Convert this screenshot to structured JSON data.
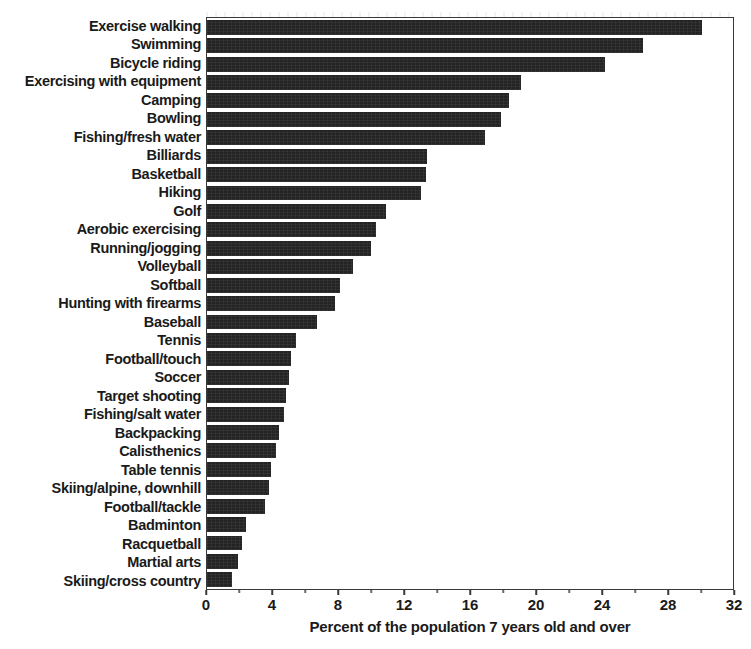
{
  "chart_data": {
    "type": "bar",
    "orientation": "horizontal",
    "title": "",
    "xlabel": "Percent of the population 7 years old and over",
    "ylabel": "",
    "xlim": [
      0,
      32
    ],
    "xticks": [
      0,
      4,
      8,
      12,
      16,
      20,
      24,
      28,
      32
    ],
    "xtick_labels": [
      "0",
      "4",
      "8",
      "12",
      "16",
      "20",
      "24",
      "28",
      "32"
    ],
    "grid": false,
    "legend": false,
    "bar_color": "#242424",
    "frame_color": "#3a3a3a",
    "categories": [
      "Exercise walking",
      "Swimming",
      "Bicycle riding",
      "Exercising with equipment",
      "Camping",
      "Bowling",
      "Fishing/fresh water",
      "Billiards",
      "Basketball",
      "Hiking",
      "Golf",
      "Aerobic exercising",
      "Running/jogging",
      "Volleyball",
      "Softball",
      "Hunting with firearms",
      "Baseball",
      "Tennis",
      "Football/touch",
      "Soccer",
      "Target shooting",
      "Fishing/salt water",
      "Backpacking",
      "Calisthenics",
      "Table tennis",
      "Skiing/alpine, downhill",
      "Football/tackle",
      "Badminton",
      "Racquetball",
      "Martial arts",
      "Skiing/cross country"
    ],
    "values": [
      30.1,
      26.5,
      24.2,
      19.1,
      18.4,
      17.9,
      16.9,
      13.4,
      13.3,
      13.0,
      10.9,
      10.3,
      10.0,
      8.9,
      8.1,
      7.8,
      6.7,
      5.4,
      5.1,
      5.0,
      4.8,
      4.7,
      4.4,
      4.2,
      3.9,
      3.8,
      3.5,
      2.4,
      2.1,
      1.9,
      1.5
    ]
  }
}
